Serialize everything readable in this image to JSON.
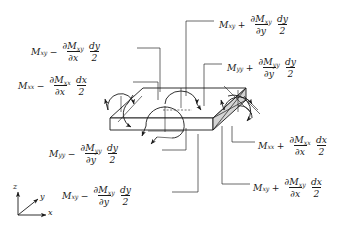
{
  "figure": {
    "line_color": "#1a1a1a",
    "face_shade_color": "#d4d4d4",
    "background": "#ffffff"
  },
  "axes": {
    "x": "x",
    "y": "y",
    "z": "z"
  },
  "labels": [
    {
      "id": "mxy-minus-x",
      "moment": "M",
      "moment_sub": "xy",
      "operator": "−",
      "partial_num": "∂M",
      "partial_num_sub": "xy",
      "partial_den": "∂x",
      "diff_num": "dy",
      "diff_den": "2"
    },
    {
      "id": "mxx-minus-x",
      "moment": "M",
      "moment_sub": "xx",
      "operator": "−",
      "partial_num": "∂M",
      "partial_num_sub": "xx",
      "partial_den": "∂x",
      "diff_num": "dx",
      "diff_den": "2"
    },
    {
      "id": "mxy-plus-y",
      "moment": "M",
      "moment_sub": "xy",
      "operator": "+",
      "partial_num": "∂M",
      "partial_num_sub": "xy",
      "partial_den": "∂y",
      "diff_num": "dy",
      "diff_den": "2"
    },
    {
      "id": "myy-plus-y",
      "moment": "M",
      "moment_sub": "yy",
      "operator": "+",
      "partial_num": "∂M",
      "partial_num_sub": "yy",
      "partial_den": "∂y",
      "diff_num": "dy",
      "diff_den": "2"
    },
    {
      "id": "myy-minus-y",
      "moment": "M",
      "moment_sub": "yy",
      "operator": "−",
      "partial_num": "∂M",
      "partial_num_sub": "yy",
      "partial_den": "∂y",
      "diff_num": "dy",
      "diff_den": "2"
    },
    {
      "id": "mxy-minus-y",
      "moment": "M",
      "moment_sub": "xy",
      "operator": "−",
      "partial_num": "∂M",
      "partial_num_sub": "xy",
      "partial_den": "∂y",
      "diff_num": "dy",
      "diff_den": "2"
    },
    {
      "id": "mxx-plus-x",
      "moment": "M",
      "moment_sub": "xx",
      "operator": "+",
      "partial_num": "∂M",
      "partial_num_sub": "xx",
      "partial_den": "∂x",
      "diff_num": "dx",
      "diff_den": "2"
    },
    {
      "id": "mxy-plus-x",
      "moment": "M",
      "moment_sub": "xy",
      "operator": "+",
      "partial_num": "∂M",
      "partial_num_sub": "xy",
      "partial_den": "∂x",
      "diff_num": "dx",
      "diff_den": "2"
    }
  ]
}
